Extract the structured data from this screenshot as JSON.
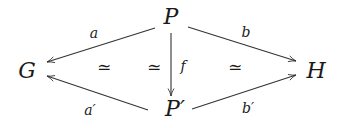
{
  "diagram": {
    "type": "commutative-diagram",
    "nodes": [
      {
        "id": "G",
        "label": "G",
        "x": 27,
        "y": 71
      },
      {
        "id": "P",
        "label": "P",
        "x": 171,
        "y": 25
      },
      {
        "id": "Pprime",
        "label": "P′",
        "x": 173,
        "y": 118
      },
      {
        "id": "H",
        "label": "H",
        "x": 316,
        "y": 71
      }
    ],
    "edges": [
      {
        "id": "a",
        "from": "P",
        "to": "G",
        "label": "a"
      },
      {
        "id": "b",
        "from": "P",
        "to": "H",
        "label": "b"
      },
      {
        "id": "f",
        "from": "P",
        "to": "Pprime",
        "label": "f"
      },
      {
        "id": "aprime",
        "from": "Pprime",
        "to": "G",
        "label": "a′"
      },
      {
        "id": "bprime",
        "from": "Pprime",
        "to": "H",
        "label": "b′"
      }
    ],
    "annotations": [
      {
        "id": "iso-left",
        "label": "≃"
      },
      {
        "id": "iso-f",
        "label": "≃"
      },
      {
        "id": "iso-right",
        "label": "≃"
      }
    ]
  }
}
